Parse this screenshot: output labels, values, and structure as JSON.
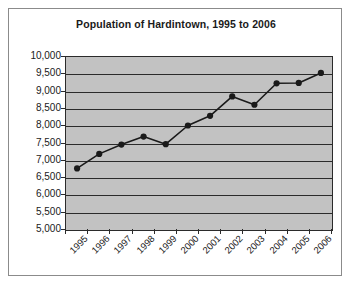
{
  "chart_data": {
    "type": "line",
    "title": "Population of Hardintown, 1995 to 2006",
    "xlabel": "",
    "ylabel": "",
    "categories": [
      "1995",
      "1996",
      "1997",
      "1998",
      "1999",
      "2000",
      "2001",
      "2002",
      "2003",
      "2004",
      "2005",
      "2006"
    ],
    "values": [
      6780,
      7200,
      7470,
      7700,
      7480,
      8020,
      8300,
      8860,
      8620,
      9240,
      9250,
      9540
    ],
    "series": [
      {
        "name": "Population",
        "values": [
          6780,
          7200,
          7470,
          7700,
          7480,
          8020,
          8300,
          8860,
          8620,
          9240,
          9250,
          9540
        ]
      }
    ],
    "ylim": [
      5000,
      10000
    ],
    "ytick_values": [
      5000,
      5500,
      6000,
      6500,
      7000,
      7500,
      8000,
      8500,
      9000,
      9500,
      10000
    ],
    "ytick_labels": [
      "5,000",
      "5,500",
      "6,000",
      "6,500",
      "7,000",
      "7,500",
      "8,000",
      "8,500",
      "9,000",
      "9,500",
      "10,000"
    ],
    "grid": true,
    "grid_orientation": "horizontal",
    "legend": false,
    "legend_position": "none",
    "marker": "circle",
    "colors": {
      "line": "#1a1a1a",
      "marker": "#1a1a1a",
      "plot_background": "#c2c2c2",
      "grid": "#2b2b2b",
      "axis": "#2b2b2b",
      "figure_background": "#ffffff",
      "text": "#1a1a1a",
      "border": "#8b8b8b"
    }
  }
}
